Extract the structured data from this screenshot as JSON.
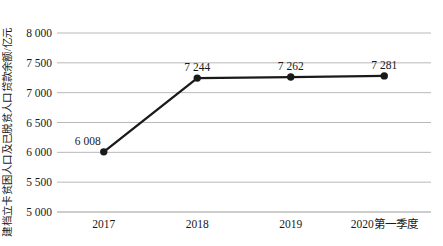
{
  "chart": {
    "y_axis_title": "建档立卡贫困人口及已脱贫人口贷款余额/亿元"
  },
  "chart_data": {
    "type": "line",
    "title": "",
    "xlabel": "",
    "ylabel": "建档立卡贫困人口及已脱贫人口贷款余额/亿元",
    "categories": [
      "2017",
      "2018",
      "2019",
      "2020第一季度"
    ],
    "series": [
      {
        "name": "建档立卡贫困人口及已脱贫人口贷款余额",
        "values": [
          6008,
          7244,
          7262,
          7281
        ],
        "point_labels": [
          "6 008",
          "7 244",
          "7 262",
          "7 281"
        ]
      }
    ],
    "ylim": [
      5000,
      8000
    ],
    "ytick_step": 500,
    "ytick_labels": [
      "5 000",
      "5 500",
      "6 000",
      "6 500",
      "7 000",
      "7 500",
      "8 000"
    ],
    "grid": true,
    "legend_position": "none",
    "colors": {
      "line": "#1a1a1a",
      "marker": "#1a1a1a",
      "gridline": "#b8b8b8",
      "baseline": "#9a9a9a",
      "text": "#1a1a1a",
      "background": "#ffffff"
    }
  }
}
